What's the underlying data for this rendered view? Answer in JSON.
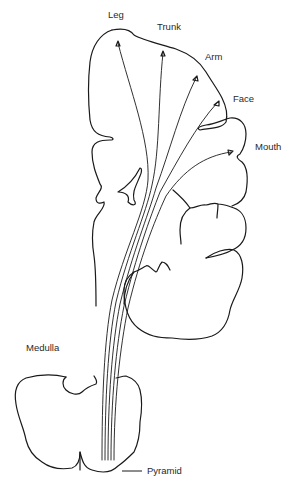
{
  "diagram": {
    "type": "anatomical-pathway",
    "stroke_color": "#1a1a1a",
    "background": "#ffffff",
    "labels": {
      "leg": "Leg",
      "trunk": "Trunk",
      "arm": "Arm",
      "face": "Face",
      "mouth": "Mouth",
      "medulla": "Medulla",
      "pyramid": "Pyramid"
    },
    "fiber_origins": [
      {
        "region": "Leg",
        "x": 118,
        "y": 43
      },
      {
        "region": "Trunk",
        "x": 163,
        "y": 53
      },
      {
        "region": "Arm",
        "x": 196,
        "y": 78
      },
      {
        "region": "Face",
        "x": 217,
        "y": 103
      },
      {
        "region": "Mouth",
        "x": 231,
        "y": 152
      }
    ],
    "fiber_count": 5
  }
}
